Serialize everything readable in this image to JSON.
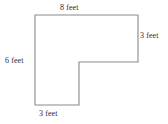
{
  "figure": {
    "kind": "l-shaped-polygon-diagram",
    "shape_name": "L-shape",
    "unit": "feet",
    "stroke_color": "#8a8a8a",
    "fill_color": "#ffffff",
    "text_color": "#2b2b2b",
    "background_color": "#ffffff",
    "vertices": [
      [
        35,
        15
      ],
      [
        138,
        15
      ],
      [
        138,
        62
      ],
      [
        79,
        62
      ],
      [
        79,
        105
      ],
      [
        35,
        105
      ]
    ],
    "labels": {
      "top": "8 feet",
      "right": "3 feet",
      "left": "6 feet",
      "bottom": "3 feet"
    },
    "measurements": [
      {
        "side": "top",
        "value": 8,
        "unit": "feet",
        "text": "8 feet"
      },
      {
        "side": "right",
        "value": 3,
        "unit": "feet",
        "text": "3 feet"
      },
      {
        "side": "left",
        "value": 6,
        "unit": "feet",
        "text": "6 feet"
      },
      {
        "side": "bottom",
        "value": 3,
        "unit": "feet",
        "text": "3 feet"
      }
    ]
  }
}
